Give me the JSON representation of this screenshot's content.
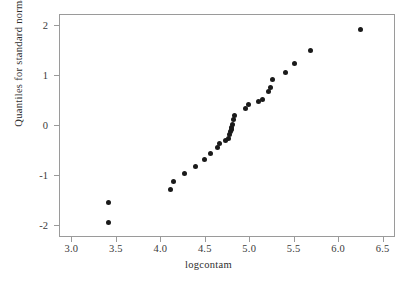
{
  "chart_data": {
    "type": "scatter",
    "title": "",
    "subtitle": "",
    "xlabel": "logcontam",
    "ylabel": "Quantiles for standard normal",
    "xlim": [
      2.86,
      6.64
    ],
    "ylim": [
      -2.25,
      2.22
    ],
    "xticks": [
      "3.0",
      "3.5",
      "4.0",
      "4.5",
      "5.0",
      "5.5",
      "6.0",
      "6.5"
    ],
    "xtick_values": [
      3.0,
      3.5,
      4.0,
      4.5,
      5.0,
      5.5,
      6.0,
      6.5
    ],
    "yticks": [
      "2",
      "1",
      "0",
      "-1",
      "-2"
    ],
    "ytick_values": [
      2,
      1,
      0,
      -1,
      -2
    ],
    "grid": false,
    "legend": "none",
    "marker": "filled-circle",
    "marker_color": "#1a1a1a",
    "marker_size": 5,
    "frame_color": "#9a9a9a",
    "background": "#ffffff",
    "n_points": 30,
    "x": [
      3.4,
      3.4,
      4.1,
      4.14,
      4.26,
      4.38,
      4.49,
      4.55,
      4.63,
      4.65,
      4.75,
      4.77,
      4.78,
      4.79,
      4.79,
      4.8,
      4.81,
      4.82,
      4.95,
      4.98,
      5.14,
      5.21,
      5.23,
      5.25,
      5.4,
      5.5,
      5.68,
      6.24,
      4.72,
      5.09
    ],
    "y": [
      -1.53,
      -1.93,
      -1.27,
      -1.11,
      -0.96,
      -0.81,
      -0.67,
      -0.55,
      -0.43,
      -0.35,
      -0.26,
      -0.17,
      -0.12,
      -0.08,
      -0.03,
      0.03,
      0.13,
      0.21,
      0.35,
      0.43,
      0.52,
      0.68,
      0.76,
      0.92,
      1.07,
      1.25,
      1.5,
      1.93,
      -0.3,
      0.48
    ],
    "points": [
      {
        "x": 3.4,
        "y": -1.53
      },
      {
        "x": 3.4,
        "y": -1.93
      },
      {
        "x": 4.1,
        "y": -1.27
      },
      {
        "x": 4.14,
        "y": -1.11
      },
      {
        "x": 4.26,
        "y": -0.96
      },
      {
        "x": 4.38,
        "y": -0.81
      },
      {
        "x": 4.49,
        "y": -0.67
      },
      {
        "x": 4.55,
        "y": -0.55
      },
      {
        "x": 4.63,
        "y": -0.43
      },
      {
        "x": 4.65,
        "y": -0.35
      },
      {
        "x": 4.72,
        "y": -0.3
      },
      {
        "x": 4.75,
        "y": -0.26
      },
      {
        "x": 4.77,
        "y": -0.17
      },
      {
        "x": 4.78,
        "y": -0.12
      },
      {
        "x": 4.79,
        "y": -0.08
      },
      {
        "x": 4.79,
        "y": -0.03
      },
      {
        "x": 4.8,
        "y": 0.03
      },
      {
        "x": 4.81,
        "y": 0.13
      },
      {
        "x": 4.82,
        "y": 0.21
      },
      {
        "x": 4.95,
        "y": 0.35
      },
      {
        "x": 4.98,
        "y": 0.43
      },
      {
        "x": 5.09,
        "y": 0.48
      },
      {
        "x": 5.14,
        "y": 0.52
      },
      {
        "x": 5.21,
        "y": 0.68
      },
      {
        "x": 5.23,
        "y": 0.76
      },
      {
        "x": 5.25,
        "y": 0.92
      },
      {
        "x": 5.4,
        "y": 1.07
      },
      {
        "x": 5.5,
        "y": 1.25
      },
      {
        "x": 5.68,
        "y": 1.5
      },
      {
        "x": 6.24,
        "y": 1.93
      }
    ]
  }
}
